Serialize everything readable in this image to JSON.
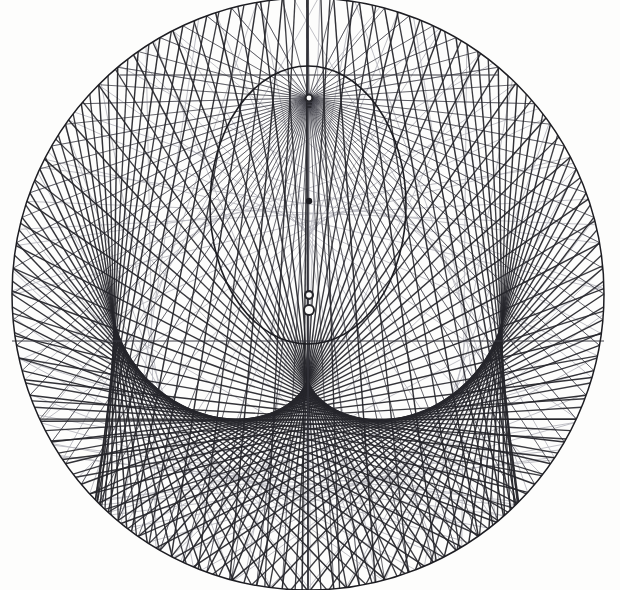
{
  "figure": {
    "canvas": {
      "width": 620,
      "height": 590,
      "background": "#fdfdfc"
    },
    "ink": {
      "primary": "#26262b",
      "secondary": "#3a3a42",
      "faint": "#b9b9c0",
      "outline": "#1d1d22"
    }
  },
  "chart_data": {
    "type": "line",
    "subtitle": "",
    "xlabel": "",
    "ylabel": "",
    "grid": false,
    "legend_position": "none",
    "xlim": [
      0,
      620
    ],
    "ylim": [
      0,
      590
    ],
    "elements": {
      "outer_circle": {
        "cx": 308,
        "cy": 294,
        "r": 296,
        "stroke": "#1d1d22",
        "stroke_width": 1.5
      },
      "caustic_envelope": {
        "cx": 308,
        "cy": 205,
        "rx": 98,
        "ry": 139,
        "stroke": "#1d1d22",
        "stroke_width": 1.6
      },
      "axis_line": {
        "x1": 308,
        "y1": 10,
        "x2": 308,
        "y2": 586,
        "stroke": "#3a3a42",
        "stroke_width": 1
      },
      "horizontal_chord": {
        "x1": 12,
        "y1": 341,
        "x2": 604,
        "y2": 341,
        "stroke": "#3a3a42",
        "stroke_width": 1
      },
      "upper_horizontal_chord": {
        "x1": 120,
        "y1": 75,
        "x2": 498,
        "y2": 75,
        "stroke": "#3a3a42",
        "stroke_width": 1
      },
      "focus_point": {
        "cx": 309,
        "cy": 98,
        "r": 4.5,
        "label": "radiant-point"
      },
      "mid_dot": {
        "cx": 309,
        "cy": 201,
        "r": 3.2,
        "label": "cusp-point"
      },
      "marker_small": {
        "cx": 309,
        "cy": 295,
        "r": 5.0,
        "label": "o"
      },
      "marker_large": {
        "cx": 309,
        "cy": 310,
        "r": 6.0,
        "label": "O"
      },
      "bottom_node": {
        "cx": 309,
        "cy": 470,
        "r": 0,
        "label": "lower-convergence"
      }
    },
    "series": [
      {
        "name": "reflected-rays-dark",
        "count": 72,
        "stroke": "#26262b",
        "stroke_width": 1.45
      },
      {
        "name": "reflected-rays-faint",
        "count": 44,
        "stroke": "#b9b9c0",
        "stroke_width": 1.0
      },
      {
        "name": "incident-rays",
        "count": 60,
        "stroke": "#3a3a42",
        "stroke_width": 0.9
      }
    ],
    "geometry_notes": {
      "source_angle_deg": 90,
      "reflection_law": "angle of incidence equals angle of reflection",
      "caustic_type": "cardioid-like cusp envelope",
      "ray_spacing_deg": 5
    }
  },
  "labels": {
    "point_o_lower": "o",
    "point_O_lower": "O",
    "radiant": ""
  }
}
